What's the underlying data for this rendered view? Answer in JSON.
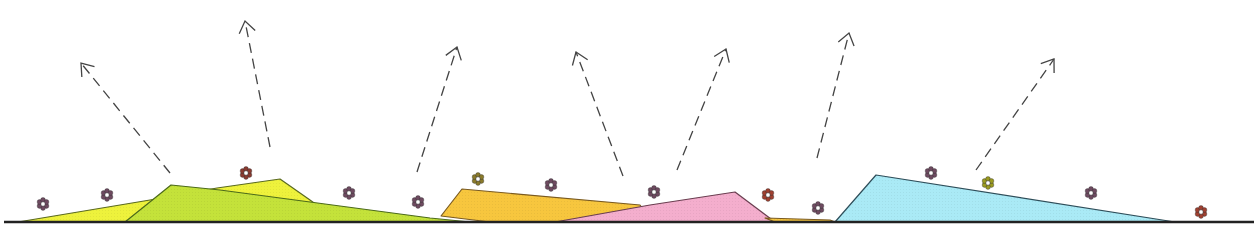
{
  "canvas": {
    "width": 1254,
    "height": 231,
    "background": "#ffffff"
  },
  "ground": {
    "y": 222,
    "x1": 4,
    "x2": 1254,
    "color": "#222222",
    "width": 2.5
  },
  "hills": [
    {
      "name": "hill-yellow-left",
      "color": "#eef23c",
      "stroke": "#5a6a20",
      "points": [
        [
          18,
          222
        ],
        [
          150,
          200
        ],
        [
          217,
          188
        ],
        [
          280,
          179
        ],
        [
          310,
          200
        ],
        [
          340,
          222
        ]
      ]
    },
    {
      "name": "hill-lime",
      "color": "#c4e23a",
      "stroke": "#4c6a1a",
      "points": [
        [
          125,
          222
        ],
        [
          171,
          185
        ],
        [
          220,
          190
        ],
        [
          430,
          218
        ],
        [
          470,
          222
        ]
      ]
    },
    {
      "name": "hill-orange",
      "color": "#f7c63e",
      "stroke": "#7a5a20",
      "points": [
        [
          441,
          216
        ],
        [
          462,
          189
        ],
        [
          640,
          205
        ],
        [
          650,
          218
        ],
        [
          560,
          222
        ],
        [
          490,
          222
        ]
      ]
    },
    {
      "name": "hill-pink",
      "color": "#f4aecd",
      "stroke": "#6a3e50",
      "points": [
        [
          555,
          222
        ],
        [
          650,
          205
        ],
        [
          735,
          192
        ],
        [
          775,
          222
        ]
      ]
    },
    {
      "name": "hill-orange-small",
      "color": "#f7c63e",
      "stroke": "#7a5a20",
      "points": [
        [
          765,
          218
        ],
        [
          830,
          220
        ],
        [
          835,
          222
        ],
        [
          775,
          222
        ]
      ]
    },
    {
      "name": "hill-cyan",
      "color": "#aaeaf6",
      "stroke": "#2e4e5a",
      "points": [
        [
          835,
          222
        ],
        [
          876,
          175
        ],
        [
          1175,
          222
        ]
      ]
    }
  ],
  "arrows": [
    {
      "name": "arrow-1",
      "from": [
        170,
        173
      ],
      "to": [
        81,
        63
      ]
    },
    {
      "name": "arrow-2",
      "from": [
        270,
        147
      ],
      "to": [
        245,
        21
      ]
    },
    {
      "name": "arrow-3",
      "from": [
        417,
        172
      ],
      "to": [
        457,
        47
      ]
    },
    {
      "name": "arrow-4",
      "from": [
        623,
        176
      ],
      "to": [
        576,
        52
      ]
    },
    {
      "name": "arrow-5",
      "from": [
        677,
        170
      ],
      "to": [
        726,
        49
      ]
    },
    {
      "name": "arrow-6",
      "from": [
        817,
        158
      ],
      "to": [
        849,
        33
      ]
    },
    {
      "name": "arrow-7",
      "from": [
        976,
        170
      ],
      "to": [
        1054,
        59
      ]
    }
  ],
  "arrow_style": {
    "color": "#444444",
    "dash": "10,6",
    "width": 1.3,
    "head": 14
  },
  "flowers": [
    {
      "x": 43,
      "y": 204,
      "color": "#6e4a60"
    },
    {
      "x": 107,
      "y": 195,
      "color": "#6e4a60"
    },
    {
      "x": 246,
      "y": 173,
      "color": "#8a3a30"
    },
    {
      "x": 349,
      "y": 193,
      "color": "#6e4a60"
    },
    {
      "x": 418,
      "y": 202,
      "color": "#6e4a60"
    },
    {
      "x": 478,
      "y": 179,
      "color": "#8a7a2a"
    },
    {
      "x": 551,
      "y": 185,
      "color": "#6e4a60"
    },
    {
      "x": 654,
      "y": 192,
      "color": "#6e4a60"
    },
    {
      "x": 768,
      "y": 195,
      "color": "#a04030"
    },
    {
      "x": 818,
      "y": 208,
      "color": "#6e4a60"
    },
    {
      "x": 931,
      "y": 173,
      "color": "#6e4a60"
    },
    {
      "x": 988,
      "y": 183,
      "color": "#9a9a20"
    },
    {
      "x": 1091,
      "y": 193,
      "color": "#6e4a60"
    },
    {
      "x": 1201,
      "y": 212,
      "color": "#a04030"
    }
  ],
  "icons": {
    "flower": "flower-icon",
    "arrow": "dashed-arrow-up-icon"
  }
}
